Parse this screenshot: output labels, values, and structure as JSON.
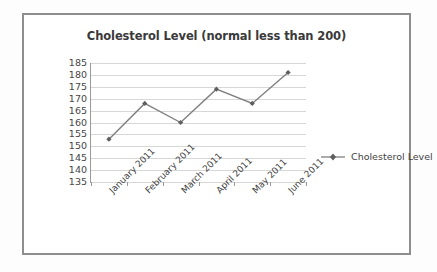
{
  "frame": {
    "border_color": "#8e8e8e"
  },
  "chart_data": {
    "type": "line",
    "title": "Cholesterol Level (normal less than 200)",
    "xlabel": "",
    "ylabel": "",
    "categories": [
      "January 2011",
      "February 2011",
      "March 2011",
      "April 2011",
      "May 2011",
      "June 2011"
    ],
    "series": [
      {
        "name": "Cholesterol Level",
        "values": [
          153,
          168,
          160,
          174,
          168,
          181
        ],
        "color": "#7f7f7f",
        "marker": "diamond"
      }
    ],
    "ylim": [
      135,
      185
    ],
    "ytick_step": 5,
    "yticks": [
      185,
      180,
      175,
      170,
      165,
      160,
      155,
      150,
      145,
      140,
      135
    ],
    "grid": true,
    "legend_position": "right",
    "legend_entries": [
      "Cholesterol Level"
    ],
    "gridline_color": "#d7d7d7",
    "axis_color": "#9a9a9a"
  }
}
